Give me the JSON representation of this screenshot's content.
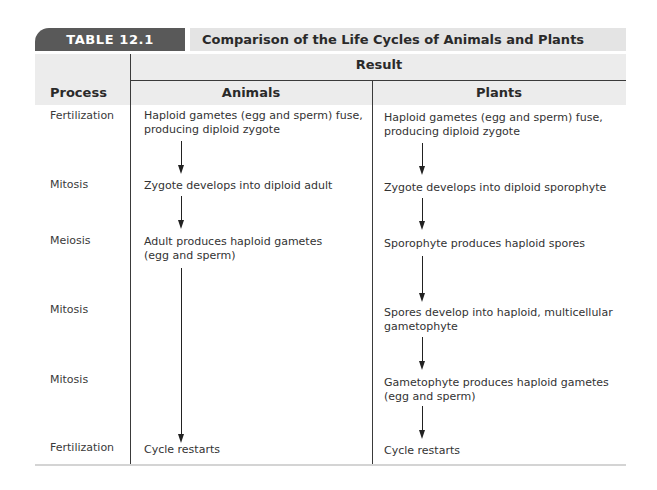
{
  "table": {
    "number": "TABLE 12.1",
    "title": "Comparison of the Life Cycles of Animals and Plants",
    "header": {
      "group_label": "Result",
      "columns": [
        "Process",
        "Animals",
        "Plants"
      ]
    },
    "rows": [
      {
        "process": "Fertilization",
        "animals": "Haploid gametes (egg and sperm) fuse, producing diploid zygote",
        "plants": "Haploid gametes (egg and sperm) fuse, producing diploid zygote"
      },
      {
        "process": "Mitosis",
        "animals": "Zygote develops into diploid adult",
        "plants": "Zygote develops into diploid sporophyte"
      },
      {
        "process": "Meiosis",
        "animals": "Adult produces haploid gametes (egg and sperm)",
        "plants": "Sporophyte produces haploid spores"
      },
      {
        "process": "Mitosis",
        "animals": "",
        "plants": "Spores develop into haploid, multicellular gametophyte"
      },
      {
        "process": "Mitosis",
        "animals": "",
        "plants": "Gametophyte produces haploid gametes (egg and sperm)"
      },
      {
        "process": "Fertilization",
        "animals": "Cycle restarts",
        "plants": "Cycle restarts"
      }
    ]
  },
  "colors": {
    "tab_bg": "#595959",
    "titlebar_bg": "#e4e4e4",
    "header_bg": "#ececec",
    "rule": "#3a3a3a"
  },
  "icons": {
    "arrow": "down-arrow-icon"
  }
}
